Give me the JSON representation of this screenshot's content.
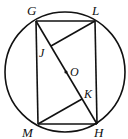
{
  "diagram": {
    "type": "geometry",
    "circle": {
      "center_label": "O",
      "cx": 65,
      "cy": 72,
      "r": 60
    },
    "points": {
      "G": {
        "x": 36,
        "y": 21
      },
      "L": {
        "x": 95,
        "y": 21
      },
      "M": {
        "x": 38,
        "y": 124
      },
      "H": {
        "x": 97,
        "y": 124
      },
      "J": {
        "x": 51,
        "y": 46
      },
      "K": {
        "x": 82,
        "y": 99
      },
      "O": {
        "x": 66,
        "y": 72
      }
    },
    "labels": {
      "G": "G",
      "L": "L",
      "M": "M",
      "H": "H",
      "J": "J",
      "K": "K",
      "O": "O"
    },
    "segments": [
      "GL",
      "LH",
      "HM",
      "MG",
      "GH",
      "LJ",
      "MK"
    ]
  }
}
